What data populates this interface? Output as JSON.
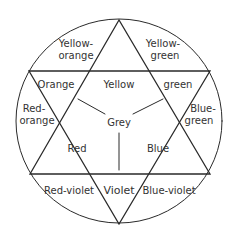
{
  "diagram": {
    "title": "",
    "type": "color-wheel-star",
    "colors": {
      "line": "#2a2a2a",
      "text": "#333333",
      "background": "#ffffff"
    },
    "regions": {
      "center": {
        "label": "Grey"
      },
      "primaries": [
        {
          "label": "Yellow"
        },
        {
          "label": "Red"
        },
        {
          "label": "Blue"
        }
      ],
      "secondaries": [
        {
          "label": "Orange"
        },
        {
          "label": "green"
        },
        {
          "label": "Violet"
        }
      ],
      "tertiaries": [
        {
          "line1": "Yellow-",
          "line2": "orange"
        },
        {
          "line1": "Yellow-",
          "line2": "green"
        },
        {
          "line1": "Red-",
          "line2": "orange"
        },
        {
          "line1": "Blue-",
          "line2": "green"
        },
        {
          "line1": "Red-violet"
        },
        {
          "line1": "Blue-violet"
        }
      ]
    }
  }
}
